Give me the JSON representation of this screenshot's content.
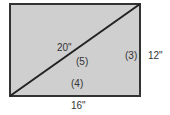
{
  "diagram": {
    "type": "rectangle-with-diagonal",
    "fill_color": "#cfcfcf",
    "stroke_color": "#333333",
    "labels": {
      "diagonal": "20\"",
      "diagonal_ratio": "(5)",
      "height": "12\"",
      "height_ratio": "(3)",
      "width": "16\"",
      "width_ratio": "(4)"
    }
  }
}
